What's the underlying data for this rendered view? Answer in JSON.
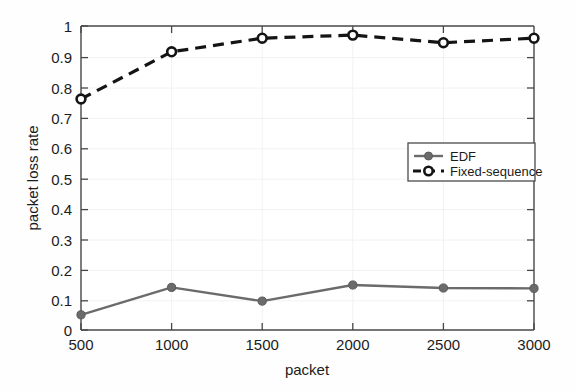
{
  "chart_data": {
    "type": "line",
    "title": "",
    "xlabel": "packet",
    "ylabel": "packet loss rate",
    "x": [
      500,
      1000,
      1500,
      2000,
      2500,
      3000
    ],
    "xlim": [
      500,
      3000
    ],
    "ylim": [
      0,
      1
    ],
    "xticks": [
      "500",
      "1000",
      "1500",
      "2000",
      "2500",
      "3000"
    ],
    "yticks": [
      "0",
      "0.1",
      "0.2",
      "0.3",
      "0.4",
      "0.5",
      "0.6",
      "0.7",
      "0.8",
      "0.9",
      "1"
    ],
    "grid": true,
    "legend_position": "center-right",
    "series": [
      {
        "name": "EDF",
        "values": [
          0.05,
          0.14,
          0.095,
          0.148,
          0.138,
          0.137
        ],
        "linestyle": "solid",
        "marker": "filled-circle",
        "color": "#6b6b6b"
      },
      {
        "name": "Fixed-sequence",
        "values": [
          0.76,
          0.915,
          0.96,
          0.97,
          0.945,
          0.96
        ],
        "linestyle": "dashed",
        "marker": "open-circle",
        "color": "#141414"
      }
    ]
  },
  "legend": {
    "items": [
      {
        "label": "EDF"
      },
      {
        "label": "Fixed-sequence"
      }
    ]
  },
  "colors": {
    "edf": "#6b6b6b",
    "fixed_sequence": "#141414",
    "axis": "#3a3a3a",
    "grid": "#f0f0f0",
    "background": "#fefefe"
  }
}
